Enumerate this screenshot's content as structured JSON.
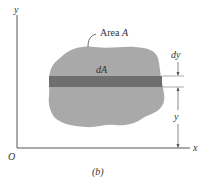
{
  "figure": {
    "caption": "(b)",
    "colors": {
      "area_fill": "#a9a9a9",
      "strip_fill": "#6e6e6e",
      "axis_stroke": "#555555",
      "text": "#333333"
    },
    "axes": {
      "x_label": "x",
      "y_label": "y",
      "origin_label": "O"
    },
    "labels": {
      "area": "Area A",
      "area_prefix": "Area ",
      "area_symbol": "A",
      "element": "dA",
      "strip_height": "dy",
      "distance": "y"
    }
  }
}
